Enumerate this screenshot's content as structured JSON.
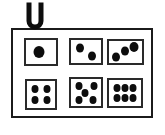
{
  "illustration": {
    "subject": "dice-faces-board-on-clip",
    "background_color": "#ffffff",
    "line_color": "#1b1b1b",
    "cell_line_color": "#2a2a2a",
    "pip_color": "#0d0d0d",
    "clip": {
      "shape": "U",
      "color": "#0d0d0d"
    },
    "board": {
      "rows": 2,
      "columns": 3,
      "cells": [
        {
          "value": 1,
          "pips": [
            {
              "x": 44,
              "y": 50,
              "d": 11
            }
          ]
        },
        {
          "value": 2,
          "pips": [
            {
              "x": 30,
              "y": 33,
              "d": 8
            },
            {
              "x": 71,
              "y": 69,
              "d": 8
            }
          ]
        },
        {
          "value": 3,
          "pips": [
            {
              "x": 20,
              "y": 71,
              "d": 8
            },
            {
              "x": 47,
              "y": 46,
              "d": 8
            },
            {
              "x": 75,
              "y": 28,
              "d": 9
            }
          ]
        },
        {
          "value": 4,
          "pips": [
            {
              "x": 30,
              "y": 29,
              "d": 7
            },
            {
              "x": 70,
              "y": 29,
              "d": 7
            },
            {
              "x": 30,
              "y": 71,
              "d": 7
            },
            {
              "x": 70,
              "y": 71,
              "d": 7
            }
          ]
        },
        {
          "value": 5,
          "pips": [
            {
              "x": 25,
              "y": 25,
              "d": 7
            },
            {
              "x": 76,
              "y": 25,
              "d": 7
            },
            {
              "x": 46,
              "y": 52,
              "d": 7
            },
            {
              "x": 26,
              "y": 78,
              "d": 7
            },
            {
              "x": 73,
              "y": 78,
              "d": 7
            }
          ]
        },
        {
          "value": 6,
          "pips": [
            {
              "x": 24,
              "y": 31,
              "d": 7
            },
            {
              "x": 50,
              "y": 31,
              "d": 7
            },
            {
              "x": 76,
              "y": 31,
              "d": 7
            },
            {
              "x": 24,
              "y": 69,
              "d": 7
            },
            {
              "x": 50,
              "y": 69,
              "d": 7
            },
            {
              "x": 76,
              "y": 69,
              "d": 7
            }
          ]
        }
      ]
    }
  }
}
